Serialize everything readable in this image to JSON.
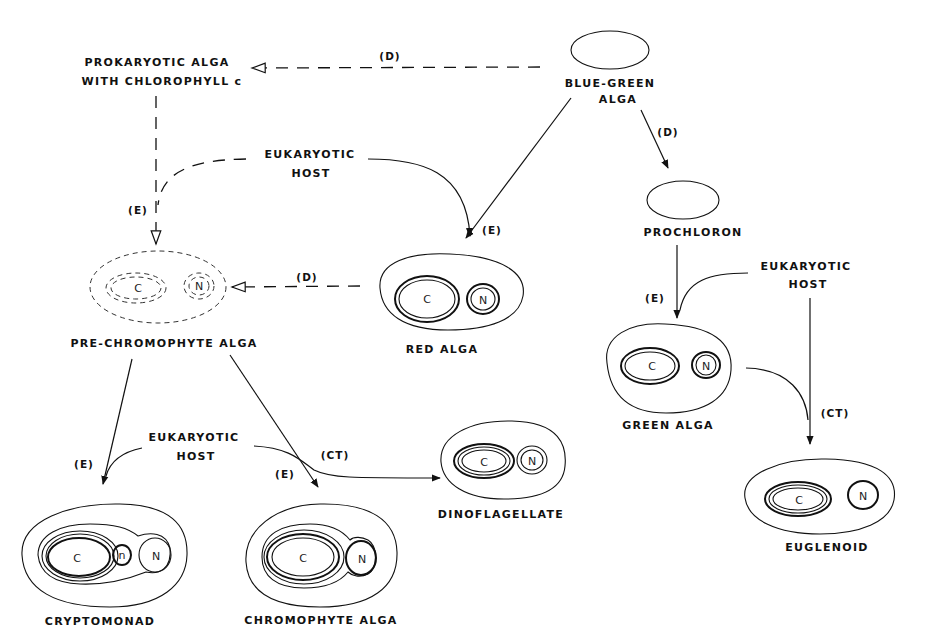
{
  "diagram": {
    "type": "endosymbiosis-evolution-flow",
    "organisms": {
      "blue_green": "BLUE-GREEN",
      "blue_green_2": "ALGA",
      "prokaryotic_1": "PROKARYOTIC  ALGA",
      "prokaryotic_2": "WITH  CHLOROPHYLL  c",
      "prochloron": "PROCHLORON",
      "pre_chromophyte": "PRE-CHROMOPHYTE  ALGA",
      "red_alga": "RED  ALGA",
      "green_alga": "GREEN  ALGA",
      "cryptomonad": "CRYPTOMONAD",
      "chromophyte": "CHROMOPHYTE  ALGA",
      "dinoflagellate": "DINOFLAGELLATE",
      "euglenoid": "EUGLENOID"
    },
    "hosts": {
      "host_line1": "EUKARYOTIC",
      "host_line2": "HOST"
    },
    "organelles": {
      "chloroplast": "C",
      "nucleus": "N",
      "nucleomorph": "n"
    },
    "edge_labels": {
      "D": "(D)",
      "E": "(E)",
      "CT": "(CT)"
    },
    "edges": [
      {
        "from": "BLUE-GREEN ALGA",
        "to": "PROKARYOTIC ALGA WITH CHLOROPHYLL c",
        "label": "(D)",
        "style": "dashed"
      },
      {
        "from": "BLUE-GREEN ALGA",
        "to": "PROCHLORON",
        "label": "(D)",
        "style": "solid"
      },
      {
        "from": "BLUE-GREEN ALGA",
        "to": "RED ALGA",
        "label": "(E)",
        "style": "solid"
      },
      {
        "from": "EUKARYOTIC HOST",
        "to": "RED ALGA",
        "label": "(E)",
        "style": "solid"
      },
      {
        "from": "PROKARYOTIC ALGA WITH CHLOROPHYLL c",
        "to": "PRE-CHROMOPHYTE ALGA",
        "label": "(E)",
        "style": "dashed"
      },
      {
        "from": "EUKARYOTIC HOST",
        "to": "PRE-CHROMOPHYTE ALGA",
        "label": "(E)",
        "style": "dashed"
      },
      {
        "from": "RED ALGA",
        "to": "PRE-CHROMOPHYTE ALGA",
        "label": "(D)",
        "style": "dashed"
      },
      {
        "from": "PROCHLORON",
        "to": "GREEN ALGA",
        "label": "(E)",
        "style": "solid"
      },
      {
        "from": "EUKARYOTIC HOST",
        "to": "GREEN ALGA",
        "label": "(E)",
        "style": "solid"
      },
      {
        "from": "GREEN ALGA",
        "to": "EUGLENOID",
        "label": "(CT)",
        "style": "solid"
      },
      {
        "from": "EUKARYOTIC HOST",
        "to": "EUGLENOID",
        "label": "(CT)",
        "style": "solid"
      },
      {
        "from": "PRE-CHROMOPHYTE ALGA",
        "to": "CRYPTOMONAD",
        "label": "(E)",
        "style": "solid"
      },
      {
        "from": "EUKARYOTIC HOST",
        "to": "CRYPTOMONAD",
        "label": "(E)",
        "style": "solid"
      },
      {
        "from": "PRE-CHROMOPHYTE ALGA",
        "to": "CHROMOPHYTE ALGA",
        "label": "(E)",
        "style": "solid"
      },
      {
        "from": "EUKARYOTIC HOST",
        "to": "DINOFLAGELLATE",
        "label": "(CT)",
        "style": "solid"
      }
    ]
  }
}
